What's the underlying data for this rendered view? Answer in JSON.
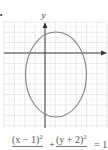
{
  "figure": {
    "axis_labels": {
      "y": "y"
    },
    "grid": {
      "unit_px": 10.4,
      "origin_px": [
        45,
        53
      ],
      "x_range_units": [
        -4,
        6
      ],
      "y_range_units": [
        -7,
        4
      ],
      "grid_color": "#d8d8d8",
      "axis_color": "#333333"
    },
    "ellipse": {
      "center": [
        1,
        -2
      ],
      "semi_axis_x": 3,
      "semi_axis_y": 4,
      "stroke_color": "#808080"
    },
    "equation": {
      "term1_numerator": "(x − 1)",
      "term1_exponent": "2",
      "operator": "+",
      "term2_numerator": "(y + 2)",
      "term2_exponent": "2",
      "rhs": "= 1"
    }
  }
}
